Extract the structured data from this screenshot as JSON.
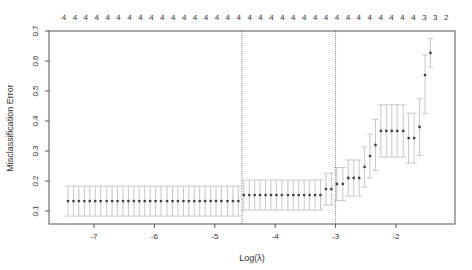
{
  "chart_data": {
    "type": "scatter",
    "title": "",
    "xlabel": "Log(λ)",
    "ylabel": "Misclassification Error",
    "xlim": [
      -7.5,
      -1.2
    ],
    "ylim": [
      0.08,
      0.7
    ],
    "x_ticks": [
      -7,
      -6,
      -5,
      -4,
      -3,
      -2
    ],
    "y_ticks": [
      0.1,
      0.2,
      0.3,
      0.4,
      0.5,
      0.6,
      0.7
    ],
    "grid": false,
    "legend": null,
    "top_axis_labels": [
      "4",
      "4",
      "4",
      "4",
      "4",
      "4",
      "4",
      "4",
      "4",
      "4",
      "4",
      "4",
      "4",
      "4",
      "4",
      "4",
      "4",
      "4",
      "4",
      "4",
      "4",
      "4",
      "4",
      "4",
      "4",
      "4",
      "4",
      "4",
      "4",
      "4",
      "4",
      "4",
      "4",
      "3",
      "3",
      "2"
    ],
    "vlines": [
      -4.55,
      -3.0
    ],
    "series": [
      {
        "name": "cv error",
        "points": [
          {
            "x": -7.43,
            "y": 0.133,
            "lo": 0.083,
            "hi": 0.183
          },
          {
            "x": -7.34,
            "y": 0.133,
            "lo": 0.083,
            "hi": 0.183
          },
          {
            "x": -7.25,
            "y": 0.133,
            "lo": 0.083,
            "hi": 0.183
          },
          {
            "x": -7.16,
            "y": 0.133,
            "lo": 0.083,
            "hi": 0.183
          },
          {
            "x": -7.07,
            "y": 0.133,
            "lo": 0.083,
            "hi": 0.183
          },
          {
            "x": -6.98,
            "y": 0.133,
            "lo": 0.083,
            "hi": 0.183
          },
          {
            "x": -6.89,
            "y": 0.133,
            "lo": 0.083,
            "hi": 0.183
          },
          {
            "x": -6.79,
            "y": 0.133,
            "lo": 0.083,
            "hi": 0.183
          },
          {
            "x": -6.7,
            "y": 0.133,
            "lo": 0.083,
            "hi": 0.183
          },
          {
            "x": -6.61,
            "y": 0.133,
            "lo": 0.083,
            "hi": 0.183
          },
          {
            "x": -6.52,
            "y": 0.133,
            "lo": 0.083,
            "hi": 0.183
          },
          {
            "x": -6.43,
            "y": 0.133,
            "lo": 0.083,
            "hi": 0.183
          },
          {
            "x": -6.34,
            "y": 0.133,
            "lo": 0.083,
            "hi": 0.183
          },
          {
            "x": -6.25,
            "y": 0.133,
            "lo": 0.083,
            "hi": 0.183
          },
          {
            "x": -6.16,
            "y": 0.133,
            "lo": 0.083,
            "hi": 0.183
          },
          {
            "x": -6.07,
            "y": 0.133,
            "lo": 0.083,
            "hi": 0.183
          },
          {
            "x": -5.98,
            "y": 0.133,
            "lo": 0.083,
            "hi": 0.183
          },
          {
            "x": -5.89,
            "y": 0.133,
            "lo": 0.083,
            "hi": 0.183
          },
          {
            "x": -5.79,
            "y": 0.133,
            "lo": 0.083,
            "hi": 0.183
          },
          {
            "x": -5.7,
            "y": 0.133,
            "lo": 0.083,
            "hi": 0.183
          },
          {
            "x": -5.61,
            "y": 0.133,
            "lo": 0.083,
            "hi": 0.183
          },
          {
            "x": -5.52,
            "y": 0.133,
            "lo": 0.083,
            "hi": 0.183
          },
          {
            "x": -5.43,
            "y": 0.133,
            "lo": 0.083,
            "hi": 0.183
          },
          {
            "x": -5.34,
            "y": 0.133,
            "lo": 0.083,
            "hi": 0.183
          },
          {
            "x": -5.25,
            "y": 0.133,
            "lo": 0.083,
            "hi": 0.183
          },
          {
            "x": -5.16,
            "y": 0.133,
            "lo": 0.083,
            "hi": 0.183
          },
          {
            "x": -5.07,
            "y": 0.133,
            "lo": 0.083,
            "hi": 0.183
          },
          {
            "x": -4.98,
            "y": 0.133,
            "lo": 0.083,
            "hi": 0.183
          },
          {
            "x": -4.89,
            "y": 0.133,
            "lo": 0.083,
            "hi": 0.183
          },
          {
            "x": -4.79,
            "y": 0.133,
            "lo": 0.083,
            "hi": 0.183
          },
          {
            "x": -4.7,
            "y": 0.133,
            "lo": 0.083,
            "hi": 0.183
          },
          {
            "x": -4.61,
            "y": 0.133,
            "lo": 0.083,
            "hi": 0.183
          },
          {
            "x": -4.52,
            "y": 0.153,
            "lo": 0.103,
            "hi": 0.203
          },
          {
            "x": -4.43,
            "y": 0.153,
            "lo": 0.103,
            "hi": 0.203
          },
          {
            "x": -4.34,
            "y": 0.153,
            "lo": 0.103,
            "hi": 0.203
          },
          {
            "x": -4.25,
            "y": 0.153,
            "lo": 0.103,
            "hi": 0.203
          },
          {
            "x": -4.16,
            "y": 0.153,
            "lo": 0.103,
            "hi": 0.203
          },
          {
            "x": -4.07,
            "y": 0.153,
            "lo": 0.103,
            "hi": 0.203
          },
          {
            "x": -3.98,
            "y": 0.153,
            "lo": 0.103,
            "hi": 0.203
          },
          {
            "x": -3.89,
            "y": 0.153,
            "lo": 0.103,
            "hi": 0.203
          },
          {
            "x": -3.79,
            "y": 0.153,
            "lo": 0.103,
            "hi": 0.203
          },
          {
            "x": -3.7,
            "y": 0.153,
            "lo": 0.103,
            "hi": 0.203
          },
          {
            "x": -3.61,
            "y": 0.153,
            "lo": 0.103,
            "hi": 0.203
          },
          {
            "x": -3.52,
            "y": 0.153,
            "lo": 0.103,
            "hi": 0.203
          },
          {
            "x": -3.43,
            "y": 0.153,
            "lo": 0.103,
            "hi": 0.203
          },
          {
            "x": -3.34,
            "y": 0.153,
            "lo": 0.103,
            "hi": 0.203
          },
          {
            "x": -3.25,
            "y": 0.153,
            "lo": 0.103,
            "hi": 0.203
          },
          {
            "x": -3.16,
            "y": 0.173,
            "lo": 0.12,
            "hi": 0.226
          },
          {
            "x": -3.07,
            "y": 0.173,
            "lo": 0.12,
            "hi": 0.226
          },
          {
            "x": -2.98,
            "y": 0.19,
            "lo": 0.135,
            "hi": 0.245
          },
          {
            "x": -2.88,
            "y": 0.19,
            "lo": 0.135,
            "hi": 0.245
          },
          {
            "x": -2.79,
            "y": 0.21,
            "lo": 0.15,
            "hi": 0.27
          },
          {
            "x": -2.7,
            "y": 0.21,
            "lo": 0.15,
            "hi": 0.27
          },
          {
            "x": -2.61,
            "y": 0.21,
            "lo": 0.15,
            "hi": 0.27
          },
          {
            "x": -2.52,
            "y": 0.247,
            "lo": 0.18,
            "hi": 0.314
          },
          {
            "x": -2.43,
            "y": 0.283,
            "lo": 0.21,
            "hi": 0.356
          },
          {
            "x": -2.34,
            "y": 0.32,
            "lo": 0.235,
            "hi": 0.405
          },
          {
            "x": -2.25,
            "y": 0.367,
            "lo": 0.28,
            "hi": 0.454
          },
          {
            "x": -2.16,
            "y": 0.367,
            "lo": 0.28,
            "hi": 0.454
          },
          {
            "x": -2.07,
            "y": 0.367,
            "lo": 0.28,
            "hi": 0.454
          },
          {
            "x": -1.98,
            "y": 0.367,
            "lo": 0.28,
            "hi": 0.454
          },
          {
            "x": -1.88,
            "y": 0.367,
            "lo": 0.28,
            "hi": 0.454
          },
          {
            "x": -1.79,
            "y": 0.343,
            "lo": 0.26,
            "hi": 0.426
          },
          {
            "x": -1.7,
            "y": 0.343,
            "lo": 0.26,
            "hi": 0.426
          },
          {
            "x": -1.61,
            "y": 0.38,
            "lo": 0.285,
            "hi": 0.475
          },
          {
            "x": -1.52,
            "y": 0.553,
            "lo": 0.425,
            "hi": 0.62
          },
          {
            "x": -1.43,
            "y": 0.627,
            "lo": 0.58,
            "hi": 0.675
          }
        ]
      }
    ]
  }
}
